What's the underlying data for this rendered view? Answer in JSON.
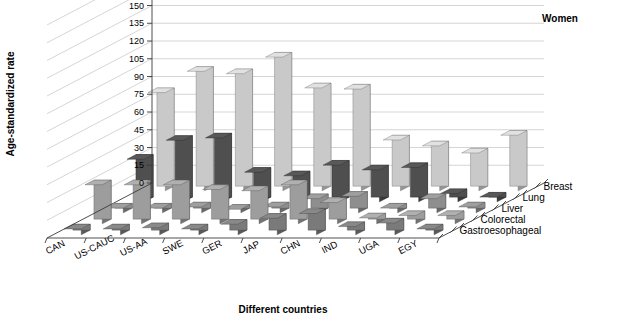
{
  "chart_data": {
    "type": "bar",
    "title": "Women",
    "xlabel": "Different countries",
    "ylabel": "Age-standardized rate",
    "zlabel": "",
    "projection": "3d-grouped-bars",
    "grid": true,
    "legend_position": "right-depth-axis",
    "ylim": [
      0,
      180
    ],
    "yticks": [
      0,
      15,
      30,
      45,
      60,
      75,
      90,
      105,
      120,
      135,
      150,
      165,
      180
    ],
    "categories": [
      "CAN",
      "US-CAUC",
      "US-AA",
      "SWE",
      "GER",
      "JAP",
      "CHN",
      "IND",
      "UGA",
      "EGY"
    ],
    "series": [
      {
        "name": "Breast",
        "color": "#c9c9c9",
        "values": [
          83,
          101,
          99,
          113,
          87,
          86,
          43,
          38,
          32,
          47
        ]
      },
      {
        "name": "Lung",
        "color": "#4f4f4f",
        "values": [
          36,
          52,
          54,
          25,
          22,
          31,
          27,
          29,
          7,
          4
        ]
      },
      {
        "name": "Liver",
        "color": "#8e8e8e",
        "values": [
          4,
          4,
          5,
          3,
          5,
          12,
          14,
          4,
          12,
          5
        ]
      },
      {
        "name": "Colorectal",
        "color": "#9d9d9d",
        "values": [
          33,
          33,
          33,
          29,
          28,
          33,
          18,
          5,
          7,
          7
        ]
      },
      {
        "name": "Gastroesophageal",
        "color": "#7a7a7a",
        "values": [
          5,
          5,
          6,
          5,
          9,
          14,
          18,
          7,
          10,
          5
        ]
      }
    ]
  },
  "axes": {
    "y_title": "Age-standardized rate",
    "x_title": "Different countries",
    "y_tick_labels": [
      "180",
      "165",
      "150",
      "135",
      "120",
      "105",
      "90",
      "75",
      "60",
      "45",
      "30",
      "15",
      "0"
    ]
  },
  "legend": {
    "items": [
      "Breast",
      "Lung",
      "Liver",
      "Colorectal",
      "Gastroesophageal"
    ]
  },
  "header": {
    "title": "Women"
  }
}
